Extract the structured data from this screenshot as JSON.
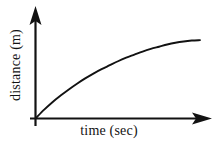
{
  "figure": {
    "background_color": "#ffffff",
    "ink_color": "#121212"
  },
  "axes": {
    "x_axis_name": "x-axis",
    "y_axis_name": "y-axis",
    "origin_label": "",
    "x_arrow_icon": "arrow-right-icon",
    "y_arrow_icon": "arrow-up-icon"
  },
  "chart_data": {
    "type": "line",
    "title": "",
    "subtitle": "",
    "xlabel": "time (sec)",
    "ylabel": "distance (m)",
    "x_tick_labels": [],
    "y_tick_labels": [],
    "grid": false,
    "legend": null,
    "legend_position": "none",
    "axis_arrows": true,
    "xlim": [
      0,
      10
    ],
    "ylim": [
      0,
      10
    ],
    "annotations": [],
    "series": [
      {
        "name": "distance",
        "description": "concave-down increasing curve starting at the origin and flattening toward the right",
        "x": [
          0.0,
          0.5,
          1.0,
          1.5,
          2.0,
          2.5,
          3.0,
          3.5,
          4.0,
          4.5,
          5.0,
          5.5,
          6.0,
          6.5,
          7.0,
          7.5,
          8.0,
          8.5,
          9.0,
          9.5,
          10.0
        ],
        "y": [
          0.0,
          0.95,
          1.8,
          2.55,
          3.25,
          3.9,
          4.5,
          5.05,
          5.55,
          6.0,
          6.45,
          6.85,
          7.2,
          7.55,
          7.85,
          8.1,
          8.35,
          8.55,
          8.7,
          8.8,
          8.85
        ]
      }
    ]
  }
}
